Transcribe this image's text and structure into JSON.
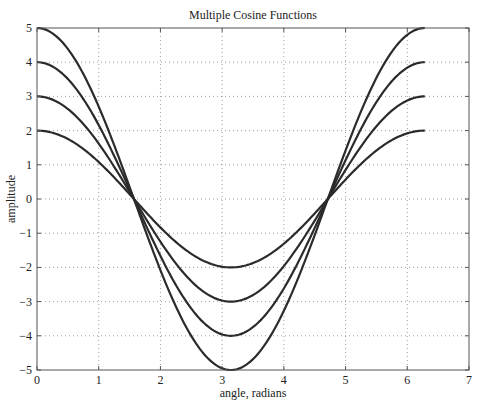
{
  "chart_data": {
    "type": "line",
    "title": "Multiple Cosine Functions",
    "xlabel": "angle, radians",
    "ylabel": "amplitude",
    "xlim": [
      0,
      7
    ],
    "ylim": [
      -5,
      5
    ],
    "xticks": [
      "0",
      "1",
      "2",
      "3",
      "4",
      "5",
      "6",
      "7"
    ],
    "yticks": [
      "5",
      "4",
      "3",
      "2",
      "1",
      "0",
      "−1",
      "−2",
      "−3",
      "−4",
      "−5"
    ],
    "grid": true,
    "grid_style": "dotted",
    "legend": "none",
    "x_domain": [
      0,
      6.2832
    ],
    "function": "A*cos(x)",
    "series": [
      {
        "name": "2cos(x)",
        "amplitude": 2,
        "color": "#2b2b2b"
      },
      {
        "name": "3cos(x)",
        "amplitude": 3,
        "color": "#2b2b2b"
      },
      {
        "name": "4cos(x)",
        "amplitude": 4,
        "color": "#2b2b2b"
      },
      {
        "name": "5cos(x)",
        "amplitude": 5,
        "color": "#2b2b2b"
      }
    ]
  }
}
